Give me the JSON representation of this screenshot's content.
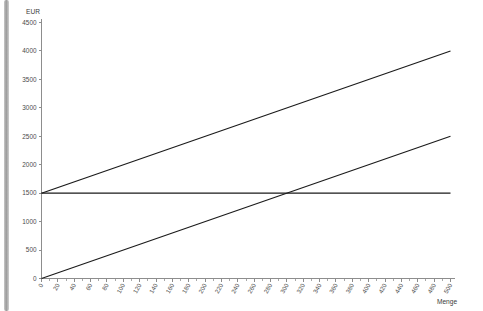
{
  "chart_data": {
    "type": "line",
    "title": "",
    "xlabel": "Menge",
    "ylabel": "EUR",
    "xlim": [
      0,
      500
    ],
    "ylim": [
      0,
      4500
    ],
    "grid": false,
    "legend_position": "none",
    "x_ticks": [
      0,
      20,
      40,
      60,
      80,
      100,
      120,
      140,
      160,
      180,
      200,
      220,
      240,
      260,
      280,
      300,
      320,
      340,
      360,
      380,
      400,
      420,
      440,
      460,
      480,
      500
    ],
    "x_tick_labels": [
      "0",
      "20",
      "40",
      "60",
      "80",
      "100",
      "120",
      "140",
      "160",
      "180",
      "200",
      "220",
      "240",
      "260",
      "280",
      "300",
      "320",
      "340",
      "360",
      "380",
      "400",
      "420",
      "440",
      "460",
      "480",
      "500"
    ],
    "y_ticks": [
      0,
      500,
      1000,
      1500,
      2000,
      2500,
      3000,
      3500,
      4000,
      4500
    ],
    "y_tick_labels": [
      "0",
      "500",
      "1000",
      "1500",
      "2000",
      "2500",
      "3000",
      "3500",
      "4000",
      "4500"
    ],
    "series": [
      {
        "name": "Gesamtkosten",
        "color": "#1a1a1a",
        "x": [
          0,
          500
        ],
        "values": [
          1500,
          4000
        ]
      },
      {
        "name": "Erloes",
        "color": "#1a1a1a",
        "x": [
          0,
          500
        ],
        "values": [
          0,
          2500
        ]
      },
      {
        "name": "Fixkosten",
        "color": "#1a1a1a",
        "x": [
          0,
          500
        ],
        "values": [
          1500,
          1500
        ]
      }
    ],
    "break_even_x": 300,
    "break_even_y": 1500
  },
  "axes": {
    "y_axis_caption": "EUR",
    "x_axis_caption": "Menge"
  },
  "scrollbar": {
    "name": "vertical-scroll-bar"
  }
}
